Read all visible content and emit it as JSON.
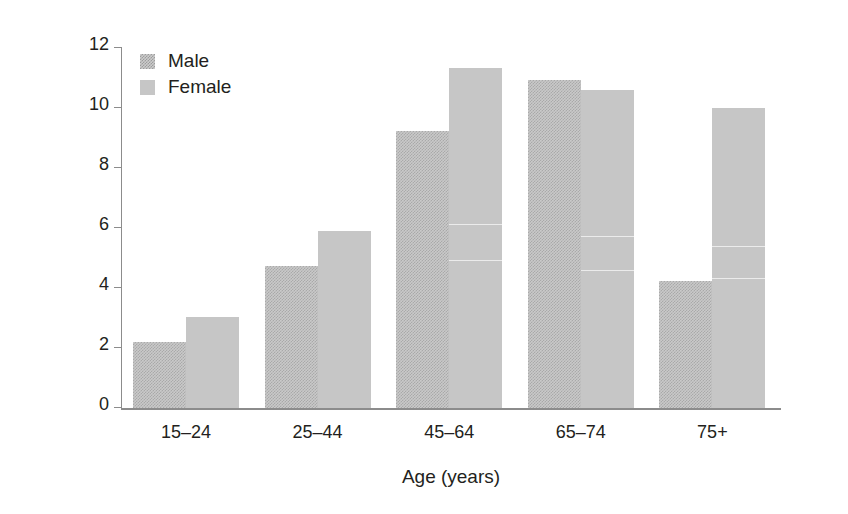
{
  "chart_data": {
    "type": "bar",
    "title": "",
    "xlabel": "Age (years)",
    "ylabel": "Incidence/1000 population",
    "categories": [
      "15–24",
      "25–44",
      "45–64",
      "65–74",
      "75+"
    ],
    "series": [
      {
        "name": "Male",
        "values": [
          2.2,
          4.75,
          9.25,
          10.95,
          4.25
        ],
        "color": "#c9c9c9",
        "pattern": "dither-checker"
      },
      {
        "name": "Female",
        "values": [
          3.05,
          5.9,
          11.35,
          10.6,
          10.0
        ],
        "color": "#c6c6c6",
        "pattern": "solid"
      }
    ],
    "ylim": [
      0,
      12
    ],
    "yticks": [
      0,
      2,
      4,
      6,
      8,
      10,
      12
    ],
    "ytick_labels": [
      "0",
      "2",
      "4",
      "6",
      "8",
      "10",
      "12"
    ],
    "grid": false,
    "legend_position": "top-left-inside"
  },
  "legend": {
    "entries": [
      {
        "label": "Male"
      },
      {
        "label": "Female"
      }
    ]
  },
  "axes": {
    "y_title": "Incidence/1000 population",
    "x_title": "Age (years)"
  }
}
